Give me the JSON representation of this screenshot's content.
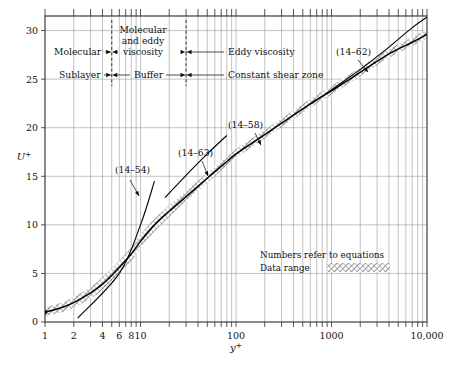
{
  "chart_data": {
    "type": "line",
    "title": "",
    "xlabel": "y+",
    "ylabel": "U+",
    "xscale": "log",
    "xlim": [
      1,
      10000
    ],
    "ylim": [
      0,
      31.5
    ],
    "grid": true,
    "legend_position": "inside-lower-right",
    "xticks": [
      {
        "value": 1,
        "label": "1"
      },
      {
        "value": 2,
        "label": "2"
      },
      {
        "value": 4,
        "label": "4"
      },
      {
        "value": 6,
        "label": "6"
      },
      {
        "value": 8,
        "label": "8"
      },
      {
        "value": 10,
        "label": "10"
      },
      {
        "value": 100,
        "label": "100"
      },
      {
        "value": 1000,
        "label": "1000"
      },
      {
        "value": 10000,
        "label": "10,000"
      }
    ],
    "yticks": [
      {
        "value": 0,
        "label": "0"
      },
      {
        "value": 5,
        "label": "5"
      },
      {
        "value": 10,
        "label": "10"
      },
      {
        "value": 15,
        "label": "15"
      },
      {
        "value": 20,
        "label": "20"
      },
      {
        "value": 25,
        "label": "25"
      },
      {
        "value": 30,
        "label": "30"
      }
    ],
    "series": [
      {
        "name": "data-range-band",
        "type": "band",
        "style": "hatched",
        "x": [
          1,
          1.5,
          2,
          3,
          4,
          5,
          6,
          8,
          10,
          14,
          20,
          30,
          50,
          80,
          100,
          200,
          400,
          700,
          1000,
          2000,
          4000,
          7000,
          10000
        ],
        "y_lower": [
          0.6,
          1.0,
          1.5,
          2.4,
          3.3,
          4.1,
          4.9,
          6.3,
          7.6,
          9.3,
          10.8,
          12.4,
          14.3,
          16.1,
          16.9,
          18.9,
          20.9,
          22.5,
          23.4,
          25.3,
          27.2,
          28.4,
          29.2
        ],
        "y_upper": [
          1.5,
          2.0,
          2.6,
          3.6,
          4.6,
          5.5,
          6.3,
          7.7,
          9.0,
          10.6,
          12.0,
          13.5,
          15.3,
          17.0,
          17.8,
          19.8,
          21.8,
          23.4,
          24.3,
          26.2,
          28.1,
          29.3,
          30.1
        ]
      },
      {
        "name": "mean-velocity-profile",
        "type": "line",
        "x": [
          1,
          1.5,
          2,
          3,
          4,
          5,
          6,
          8,
          10,
          14,
          20,
          30,
          50,
          80,
          100,
          200,
          400,
          700,
          1000,
          2000,
          4000,
          7000,
          10000
        ],
        "y": [
          1.0,
          1.5,
          2.0,
          3.0,
          3.9,
          4.8,
          5.6,
          7.0,
          8.3,
          10.0,
          11.4,
          12.9,
          14.8,
          16.5,
          17.3,
          19.3,
          21.3,
          22.9,
          23.8,
          25.7,
          27.6,
          28.8,
          29.6
        ]
      },
      {
        "name": "eq-14-54-viscous-sublayer-line",
        "type": "line",
        "x": [
          2.2,
          6,
          10,
          14
        ],
        "y": [
          0.4,
          5.0,
          10.0,
          14.5
        ]
      },
      {
        "name": "eq-14-63-line",
        "type": "line",
        "x": [
          18,
          30,
          50,
          80
        ],
        "y": [
          12.8,
          15.1,
          17.3,
          19.2
        ]
      },
      {
        "name": "eq-14-62-upper-line",
        "type": "line",
        "x": [
          600,
          1000,
          2000,
          4000,
          7000,
          10000
        ],
        "y": [
          22.4,
          23.9,
          26.0,
          28.3,
          30.3,
          31.4
        ]
      }
    ],
    "annotations": [
      {
        "name": "eq-14-54",
        "text": "(14–54)",
        "x_px": 115,
        "y_px": 173,
        "leader": [
          [
            130,
            180
          ],
          [
            139,
            196
          ]
        ]
      },
      {
        "name": "eq-14-63",
        "text": "(14–63)",
        "x_px": 178,
        "y_px": 156,
        "leader": [
          [
            202,
            161
          ],
          [
            208,
            176
          ]
        ]
      },
      {
        "name": "eq-14-58",
        "text": "(14–58)",
        "x_px": 228,
        "y_px": 128,
        "leader": [
          [
            255,
            133
          ],
          [
            261,
            145
          ]
        ]
      },
      {
        "name": "eq-14-62",
        "text": "(14–62)",
        "x_px": 336,
        "y_px": 55,
        "leader": [
          [
            358,
            60
          ],
          [
            368,
            72
          ]
        ]
      }
    ],
    "region_bands": {
      "upper_row": [
        {
          "name": "molecular-viscosity",
          "label": "Molecular",
          "label2": "and eddy",
          "label3": "viscosity"
        },
        {
          "name": "eddy-viscosity",
          "label": "Eddy viscosity"
        }
      ],
      "lower_row": [
        {
          "name": "sublayer",
          "label": "Sublayer"
        },
        {
          "name": "buffer",
          "label": "Buffer"
        },
        {
          "name": "constant-shear-zone",
          "label": "Constant shear zone"
        }
      ],
      "molecular_label": "Molecular",
      "molecular_and_eddy_line1": "Molecular",
      "molecular_and_eddy_line2": "and  eddy",
      "molecular_and_eddy_line3": "viscosity",
      "eddy_viscosity_label": "Eddy  viscosity",
      "sublayer_label": "Sublayer",
      "buffer_label": "Buffer",
      "constant_shear_label": "Constant  shear  zone",
      "divider_x_values": [
        5,
        30
      ]
    },
    "legend": {
      "note": "Numbers refer to equations",
      "data_range_label": "Data range"
    }
  },
  "axes": {
    "y_axis_title": "U",
    "y_axis_superscript": "+",
    "x_axis_title": "y",
    "x_axis_superscript": "+"
  },
  "colors": {
    "background": "#ffffff",
    "frame": "#2b2b2b",
    "grid": "#9a9a9a",
    "curve": "#000000",
    "band_hatch": "#6e6e6e"
  }
}
